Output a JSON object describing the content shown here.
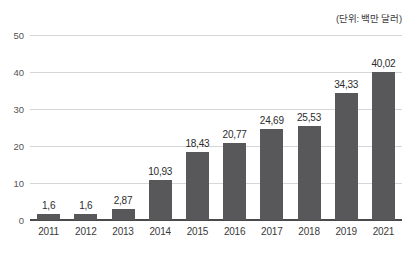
{
  "annotation": {
    "unit_note": "(단위: 백만 달러)"
  },
  "chart_data": {
    "type": "bar",
    "title": "",
    "subtitle": "",
    "xlabel": "",
    "ylabel": "",
    "unit_note": "(단위: 백만 달러)",
    "ylim": [
      0,
      50
    ],
    "yticks": [
      0,
      10,
      20,
      30,
      40,
      50
    ],
    "ytick_labels": [
      "0",
      "10",
      "20",
      "30",
      "40",
      "50"
    ],
    "grid": true,
    "legend": false,
    "decimal_separator": ",",
    "bar_color": "#58585a",
    "gridline_color": "#d6d6d6",
    "axis_color": "#4a4a4a",
    "background": "#ffffff",
    "categories": [
      "2011",
      "2012",
      "2013",
      "2014",
      "2015",
      "2016",
      "2017",
      "2018",
      "2019",
      "2021"
    ],
    "values": [
      1.6,
      1.6,
      2.87,
      10.93,
      18.43,
      20.77,
      24.69,
      25.53,
      34.33,
      40.02
    ],
    "value_labels": [
      "1,6",
      "1,6",
      "2,87",
      "10,93",
      "18,43",
      "20,77",
      "24,69",
      "25,53",
      "34,33",
      "40,02"
    ],
    "points": [
      {
        "category": "2011",
        "value": 1.6,
        "label": "1,6"
      },
      {
        "category": "2012",
        "value": 1.6,
        "label": "1,6"
      },
      {
        "category": "2013",
        "value": 2.87,
        "label": "2,87"
      },
      {
        "category": "2014",
        "value": 10.93,
        "label": "10,93"
      },
      {
        "category": "2015",
        "value": 18.43,
        "label": "18,43"
      },
      {
        "category": "2016",
        "value": 20.77,
        "label": "20,77"
      },
      {
        "category": "2017",
        "value": 24.69,
        "label": "24,69"
      },
      {
        "category": "2018",
        "value": 25.53,
        "label": "25,53"
      },
      {
        "category": "2019",
        "value": 34.33,
        "label": "34,33"
      },
      {
        "category": "2021",
        "value": 40.02,
        "label": "40,02"
      }
    ]
  }
}
